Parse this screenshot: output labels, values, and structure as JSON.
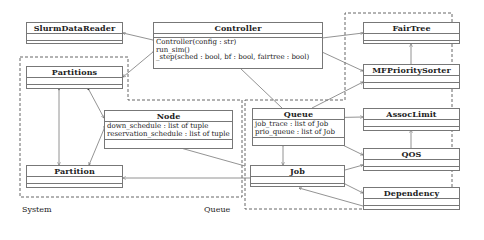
{
  "packages": {
    "system": {
      "label": "System"
    },
    "queue": {
      "label": "Queue"
    }
  },
  "classes": {
    "slurm_data_reader": {
      "name": "SlurmDataReader",
      "attributes": [],
      "methods": []
    },
    "controller": {
      "name": "Controller",
      "attributes": [],
      "methods": [
        "Controller(config : str)",
        "run_sim()",
        "_step(sched : bool, bf : bool, fairtree : bool)"
      ]
    },
    "partitions": {
      "name": "Partitions",
      "attributes": [],
      "methods": []
    },
    "node": {
      "name": "Node",
      "attributes": [
        "down_schedule : list of tuple",
        "reservation_schedule : list of tuple"
      ],
      "methods": []
    },
    "partition": {
      "name": "Partition",
      "attributes": [],
      "methods": []
    },
    "fair_tree": {
      "name": "FairTree",
      "attributes": [],
      "methods": []
    },
    "mf_priority_sorter": {
      "name": "MFPrioritySorter",
      "attributes": [],
      "methods": []
    },
    "queue": {
      "name": "Queue",
      "attributes": [
        "job_trace : list of Job",
        "prio_queue : list of Job"
      ],
      "methods": []
    },
    "assoc_limit": {
      "name": "AssocLimit",
      "attributes": [],
      "methods": []
    },
    "qos": {
      "name": "QOS",
      "attributes": [],
      "methods": []
    },
    "job": {
      "name": "Job",
      "attributes": [],
      "methods": []
    },
    "dependency": {
      "name": "Dependency",
      "attributes": [],
      "methods": []
    }
  },
  "relations": [
    {
      "from": "Controller",
      "to": "SlurmDataReader",
      "type": "composition"
    },
    {
      "from": "Controller",
      "to": "Partitions",
      "type": "composition"
    },
    {
      "from": "Controller",
      "to": "FairTree",
      "type": "composition"
    },
    {
      "from": "Controller",
      "to": "MFPrioritySorter",
      "type": "composition"
    },
    {
      "from": "Controller",
      "to": "Queue",
      "type": "composition"
    },
    {
      "from": "Partitions",
      "to": "Partition",
      "type": "composition"
    },
    {
      "from": "Partitions",
      "to": "Node",
      "type": "composition"
    },
    {
      "from": "Node",
      "to": "Partition",
      "type": "association"
    },
    {
      "from": "Queue",
      "to": "MFPrioritySorter",
      "type": "association"
    },
    {
      "from": "Queue",
      "to": "AssocLimit",
      "type": "composition"
    },
    {
      "from": "Queue",
      "to": "QOS",
      "type": "composition"
    },
    {
      "from": "Queue",
      "to": "Job",
      "type": "composition"
    },
    {
      "from": "MFPrioritySorter",
      "to": "FairTree",
      "type": "association"
    },
    {
      "from": "QOS",
      "to": "AssocLimit",
      "type": "association"
    },
    {
      "from": "Job",
      "to": "QOS",
      "type": "association"
    },
    {
      "from": "Job",
      "to": "Dependency",
      "type": "composition"
    },
    {
      "from": "Dependency",
      "to": "Job",
      "type": "association"
    },
    {
      "from": "QOS",
      "to": "Node",
      "type": "association"
    },
    {
      "from": "Job",
      "to": "Partition",
      "type": "association"
    }
  ],
  "colors": {
    "line": "#777777",
    "text": "#222222",
    "dash": "#555555"
  }
}
